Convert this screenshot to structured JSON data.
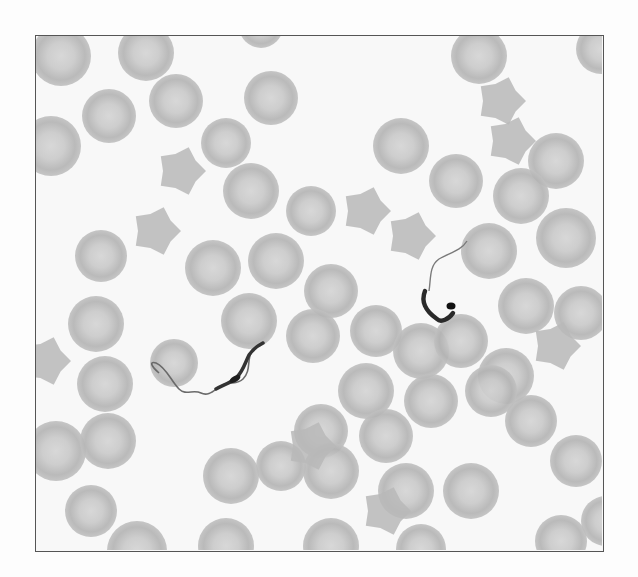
{
  "figure": {
    "colors": {
      "background": "#f8f8f8",
      "cell": "#b4b4b4",
      "cell_center": "#d2d2d2",
      "parasite": "#2a2a2a",
      "border": "#555555"
    },
    "cells": [
      [
        60,
        55,
        30
      ],
      [
        145,
        52,
        28
      ],
      [
        260,
        25,
        22
      ],
      [
        478,
        55,
        28
      ],
      [
        600,
        48,
        25
      ],
      [
        108,
        115,
        27
      ],
      [
        175,
        100,
        27
      ],
      [
        270,
        97,
        27
      ],
      [
        50,
        145,
        30
      ],
      [
        225,
        142,
        25
      ],
      [
        400,
        145,
        28
      ],
      [
        455,
        180,
        27
      ],
      [
        555,
        160,
        28
      ],
      [
        250,
        190,
        28
      ],
      [
        310,
        210,
        25
      ],
      [
        190,
        215,
        0
      ],
      [
        520,
        195,
        28
      ],
      [
        565,
        237,
        30
      ],
      [
        100,
        255,
        26
      ],
      [
        212,
        267,
        28
      ],
      [
        275,
        260,
        28
      ],
      [
        488,
        250,
        28
      ],
      [
        330,
        290,
        27
      ],
      [
        525,
        305,
        28
      ],
      [
        580,
        312,
        27
      ],
      [
        95,
        323,
        28
      ],
      [
        248,
        320,
        28
      ],
      [
        312,
        335,
        27
      ],
      [
        375,
        330,
        26
      ],
      [
        420,
        350,
        28
      ],
      [
        460,
        340,
        27
      ],
      [
        505,
        375,
        28
      ],
      [
        173,
        362,
        24
      ],
      [
        104,
        383,
        28
      ],
      [
        365,
        390,
        28
      ],
      [
        430,
        400,
        27
      ],
      [
        490,
        390,
        26
      ],
      [
        320,
        430,
        27
      ],
      [
        385,
        435,
        27
      ],
      [
        530,
        420,
        26
      ],
      [
        55,
        450,
        30
      ],
      [
        107,
        440,
        28
      ],
      [
        230,
        475,
        28
      ],
      [
        280,
        465,
        25
      ],
      [
        330,
        470,
        28
      ],
      [
        405,
        490,
        28
      ],
      [
        470,
        490,
        28
      ],
      [
        575,
        460,
        26
      ],
      [
        90,
        510,
        26
      ],
      [
        136,
        550,
        30
      ],
      [
        225,
        545,
        28
      ],
      [
        330,
        545,
        28
      ],
      [
        420,
        548,
        25
      ],
      [
        560,
        540,
        26
      ],
      [
        605,
        520,
        25
      ]
    ],
    "irregular_cells": [
      [
        180,
        170
      ],
      [
        155,
        230
      ],
      [
        365,
        210
      ],
      [
        410,
        235
      ],
      [
        500,
        100
      ],
      [
        510,
        140
      ],
      [
        555,
        345
      ],
      [
        385,
        510
      ],
      [
        310,
        445
      ],
      [
        45,
        360
      ]
    ],
    "caption": ""
  }
}
